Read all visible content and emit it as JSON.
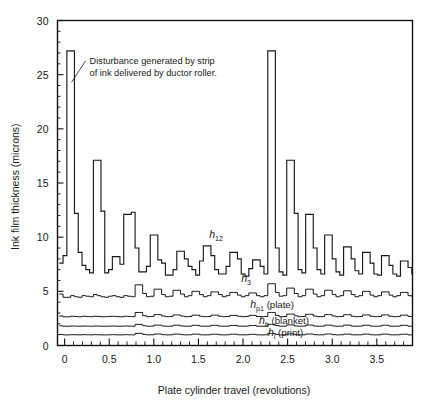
{
  "chart_data": {
    "type": "line",
    "title": "",
    "xlabel": "Plate cylinder travel (revolutions)",
    "ylabel": "Ink film thickness (microns)",
    "xlim": [
      -0.08,
      3.9
    ],
    "ylim": [
      0,
      30
    ],
    "grid": false,
    "legend_position": "inline-annotations",
    "x_ticks_major": [
      0,
      0.5,
      1.0,
      1.5,
      2.0,
      2.5,
      3.0,
      3.5
    ],
    "x_tick_labels": [
      "0",
      "0.5",
      "1.0",
      "1.5",
      "2.0",
      "2.5",
      "3.0",
      "3.5"
    ],
    "x_tick_minor_step": 0.1,
    "y_ticks_major": [
      0,
      5,
      10,
      15,
      20,
      25,
      30
    ],
    "y_tick_labels": [
      "0",
      "5",
      "10",
      "15",
      "20",
      "25",
      "30"
    ],
    "y_tick_minor_step": 1,
    "annotations": [
      {
        "name": "disturbance-note",
        "line1": "Disturbance generated by strip",
        "line2": "of ink delivered by ductor roller.",
        "x": 0.28,
        "y": 26.0,
        "points_to_x": 0.055,
        "points_to_y": 24.3
      }
    ],
    "step_width": 0.0425,
    "series": [
      {
        "name": "h12",
        "label": "h",
        "subscript": "12",
        "suffix": "",
        "label_x": 1.62,
        "label_y": 9.9,
        "x_start": -0.06,
        "values": [
          7.6,
          8.3,
          27.2,
          27.2,
          12.2,
          8.6,
          7.4,
          7.0,
          6.7,
          17.1,
          17.1,
          12.4,
          6.7,
          7.0,
          8.2,
          8.2,
          7.5,
          12.1,
          12.1,
          12.3,
          9.0,
          6.8,
          6.8,
          7.3,
          10.2,
          10.2,
          7.9,
          7.6,
          6.5,
          6.5,
          7.0,
          8.7,
          8.7,
          8.0,
          7.3,
          7.0,
          6.5,
          7.8,
          9.2,
          9.2,
          8.3,
          7.0,
          6.6,
          6.6,
          7.3,
          8.6,
          8.6,
          8.0,
          6.6,
          6.4,
          7.1,
          7.9,
          7.9,
          7.3,
          6.6,
          27.2,
          27.2,
          9.0,
          6.8,
          6.5,
          17.1,
          17.1,
          12.2,
          7.0,
          6.7,
          12.1,
          12.1,
          9.0,
          7.0,
          6.6,
          10.2,
          10.2,
          8.0,
          6.8,
          6.5,
          9.1,
          9.1,
          8.0,
          6.9,
          6.6,
          8.6,
          8.6,
          7.6,
          6.6,
          6.5,
          8.3,
          8.3,
          7.4,
          6.6,
          6.4,
          7.8,
          7.8,
          7.2,
          6.6,
          7.9
        ]
      },
      {
        "name": "h3",
        "label": "h",
        "subscript": "3",
        "suffix": "",
        "label_x": 1.98,
        "label_y": 5.9,
        "x_start": -0.06,
        "values": [
          4.75,
          4.45,
          4.45,
          4.6,
          4.5,
          4.45,
          4.6,
          4.55,
          4.5,
          4.7,
          4.6,
          4.5,
          4.45,
          4.55,
          4.6,
          4.5,
          4.45,
          4.6,
          4.55,
          4.5,
          5.6,
          5.6,
          4.8,
          4.5,
          4.55,
          5.2,
          5.2,
          4.7,
          4.5,
          4.55,
          5.1,
          5.1,
          4.75,
          4.5,
          4.6,
          5.0,
          5.0,
          4.7,
          4.5,
          4.6,
          4.95,
          4.95,
          4.7,
          4.5,
          4.6,
          4.9,
          4.9,
          4.65,
          4.5,
          4.6,
          4.85,
          4.85,
          4.6,
          4.5,
          4.6,
          5.7,
          5.7,
          4.9,
          4.55,
          4.6,
          5.3,
          5.3,
          4.8,
          4.5,
          4.6,
          5.2,
          5.2,
          4.75,
          4.5,
          4.6,
          5.1,
          5.1,
          4.7,
          4.5,
          4.6,
          5.05,
          5.05,
          4.7,
          4.5,
          4.6,
          5.0,
          5.0,
          4.65,
          4.5,
          4.6,
          4.95,
          4.95,
          4.65,
          4.5,
          4.6,
          4.9,
          4.9,
          4.6,
          4.5,
          4.6,
          4.7
        ]
      },
      {
        "name": "hp1",
        "label": "h",
        "subscript": "p1",
        "suffix": "(plate)",
        "label_x": 2.08,
        "label_y": 3.5,
        "x_start": -0.06,
        "values": [
          2.72,
          2.65,
          2.65,
          2.7,
          2.68,
          2.65,
          2.7,
          2.68,
          2.66,
          2.7,
          2.68,
          2.65,
          2.66,
          2.68,
          2.7,
          2.66,
          2.65,
          2.7,
          2.68,
          2.66,
          3.05,
          3.05,
          2.75,
          2.66,
          2.68,
          2.85,
          2.85,
          2.72,
          2.66,
          2.68,
          2.82,
          2.82,
          2.72,
          2.66,
          2.68,
          2.8,
          2.8,
          2.7,
          2.66,
          2.68,
          2.8,
          2.8,
          2.7,
          2.66,
          2.68,
          2.78,
          2.78,
          2.7,
          2.66,
          2.68,
          2.78,
          2.78,
          2.68,
          2.66,
          2.68,
          3.05,
          3.05,
          2.78,
          2.66,
          2.68,
          2.9,
          2.9,
          2.74,
          2.66,
          2.68,
          2.88,
          2.88,
          2.72,
          2.66,
          2.68,
          2.85,
          2.85,
          2.72,
          2.66,
          2.68,
          2.84,
          2.84,
          2.7,
          2.66,
          2.68,
          2.82,
          2.82,
          2.7,
          2.66,
          2.68,
          2.82,
          2.82,
          2.7,
          2.66,
          2.68,
          2.8,
          2.8,
          2.68,
          2.66,
          2.68,
          2.72
        ]
      },
      {
        "name": "hb",
        "label": "h",
        "subscript": "b",
        "suffix": "(blanket)",
        "label_x": 2.18,
        "label_y": 2.0,
        "x_start": -0.06,
        "values": [
          1.82,
          1.78,
          1.78,
          1.8,
          1.79,
          1.78,
          1.8,
          1.79,
          1.78,
          1.8,
          1.79,
          1.78,
          1.78,
          1.79,
          1.8,
          1.78,
          1.78,
          1.8,
          1.79,
          1.78,
          1.95,
          1.95,
          1.82,
          1.78,
          1.79,
          1.88,
          1.88,
          1.8,
          1.78,
          1.79,
          1.87,
          1.87,
          1.8,
          1.78,
          1.79,
          1.86,
          1.86,
          1.79,
          1.78,
          1.79,
          1.86,
          1.86,
          1.79,
          1.78,
          1.79,
          1.85,
          1.85,
          1.79,
          1.78,
          1.79,
          1.85,
          1.85,
          1.78,
          1.78,
          1.79,
          1.95,
          1.95,
          1.84,
          1.78,
          1.79,
          1.9,
          1.9,
          1.8,
          1.78,
          1.79,
          1.89,
          1.89,
          1.8,
          1.78,
          1.79,
          1.88,
          1.88,
          1.8,
          1.78,
          1.79,
          1.88,
          1.88,
          1.79,
          1.78,
          1.79,
          1.87,
          1.87,
          1.79,
          1.78,
          1.79,
          1.87,
          1.87,
          1.79,
          1.78,
          1.79,
          1.86,
          1.86,
          1.78,
          1.78,
          1.79,
          1.82
        ]
      },
      {
        "name": "hi",
        "label": "h",
        "subscript": "i",
        "suffix": "(print)",
        "label_x": 2.28,
        "label_y": 0.85,
        "x_start": -0.06,
        "values": [
          1.02,
          0.98,
          0.98,
          1.0,
          0.99,
          0.98,
          1.0,
          0.99,
          0.98,
          1.0,
          0.99,
          0.98,
          0.98,
          0.99,
          1.0,
          0.98,
          0.98,
          1.0,
          0.99,
          0.98,
          1.12,
          1.12,
          1.02,
          0.98,
          0.99,
          1.06,
          1.06,
          1.0,
          0.98,
          0.99,
          1.05,
          1.05,
          1.0,
          0.98,
          0.99,
          1.05,
          1.05,
          0.99,
          0.98,
          0.99,
          1.04,
          1.04,
          0.99,
          0.98,
          0.99,
          1.04,
          1.04,
          0.99,
          0.98,
          0.99,
          1.03,
          1.03,
          0.98,
          0.98,
          0.99,
          1.12,
          1.12,
          1.03,
          0.98,
          0.99,
          1.07,
          1.07,
          1.0,
          0.98,
          0.99,
          1.06,
          1.06,
          1.0,
          0.98,
          0.99,
          1.06,
          1.06,
          1.0,
          0.98,
          0.99,
          1.05,
          1.05,
          0.99,
          0.98,
          0.99,
          1.05,
          1.05,
          0.99,
          0.98,
          0.99,
          1.05,
          1.05,
          0.99,
          0.98,
          0.99,
          1.04,
          1.04,
          0.98,
          0.98,
          0.99,
          1.02
        ]
      }
    ]
  }
}
